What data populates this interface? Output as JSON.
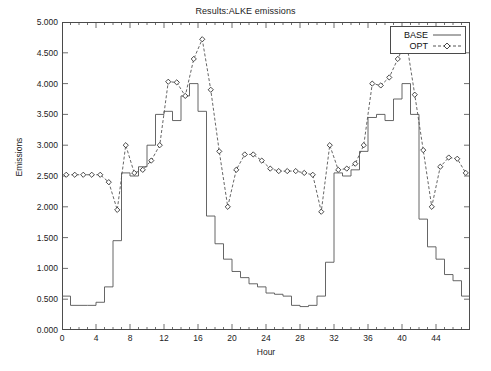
{
  "chart_data": {
    "type": "line",
    "title": "Results:ALKE emissions",
    "xlabel": "Hour",
    "ylabel": "Emissions",
    "xlim": [
      0,
      48
    ],
    "ylim": [
      0.0,
      5.0
    ],
    "ytick_step": 0.5,
    "xtick_step": 4,
    "grid": false,
    "legend_position": "top-right",
    "ytick_labels": [
      "0.000",
      "0.500",
      "1.000",
      "1.500",
      "2.000",
      "2.500",
      "3.000",
      "3.500",
      "4.000",
      "4.500",
      "5.000"
    ],
    "ytick_values": [
      0.0,
      0.5,
      1.0,
      1.5,
      2.0,
      2.5,
      3.0,
      3.5,
      4.0,
      4.5,
      5.0
    ],
    "xtick_labels": [
      "0",
      "4",
      "8",
      "12",
      "16",
      "20",
      "24",
      "28",
      "32",
      "36",
      "40",
      "44"
    ],
    "xtick_values": [
      0,
      4,
      8,
      12,
      16,
      20,
      24,
      28,
      32,
      36,
      40,
      44
    ],
    "x": [
      0,
      1,
      2,
      3,
      4,
      5,
      6,
      7,
      8,
      9,
      10,
      11,
      12,
      13,
      14,
      15,
      16,
      17,
      18,
      19,
      20,
      21,
      22,
      23,
      24,
      25,
      26,
      27,
      28,
      29,
      30,
      31,
      32,
      33,
      34,
      35,
      36,
      37,
      38,
      39,
      40,
      41,
      42,
      43,
      44,
      45,
      46,
      47
    ],
    "series": [
      {
        "name": "BASE",
        "style": "step",
        "marker": "none",
        "dash": "solid",
        "color": "#555555",
        "values": [
          0.55,
          0.4,
          0.4,
          0.4,
          0.45,
          0.7,
          1.45,
          2.55,
          2.5,
          2.65,
          3.0,
          3.5,
          3.55,
          3.4,
          3.8,
          4.0,
          3.55,
          1.85,
          1.4,
          1.15,
          0.95,
          0.85,
          0.75,
          0.7,
          0.6,
          0.58,
          0.55,
          0.4,
          0.38,
          0.4,
          0.55,
          1.1,
          2.55,
          2.5,
          2.6,
          2.9,
          3.45,
          3.5,
          3.4,
          3.75,
          4.0,
          3.5,
          1.8,
          1.35,
          1.15,
          0.9,
          0.8,
          0.55
        ]
      },
      {
        "name": "OPT",
        "style": "line",
        "marker": "diamond",
        "dash": "dashed",
        "color": "#555555",
        "values": [
          2.52,
          2.52,
          2.52,
          2.52,
          2.52,
          2.4,
          1.95,
          3.0,
          2.55,
          2.6,
          2.75,
          3.0,
          4.03,
          4.02,
          3.8,
          4.4,
          4.72,
          3.9,
          2.9,
          2.0,
          2.6,
          2.85,
          2.85,
          2.75,
          2.62,
          2.58,
          2.58,
          2.58,
          2.55,
          2.52,
          1.92,
          3.0,
          2.6,
          2.62,
          2.7,
          3.0,
          4.0,
          3.97,
          4.1,
          4.4,
          4.7,
          3.82,
          2.92,
          2.0,
          2.65,
          2.8,
          2.78,
          2.55
        ]
      }
    ]
  },
  "legend": {
    "entries": [
      {
        "label": "BASE",
        "sample": "solid-line"
      },
      {
        "label": "OPT",
        "sample": "dashed-line-diamond"
      }
    ]
  }
}
